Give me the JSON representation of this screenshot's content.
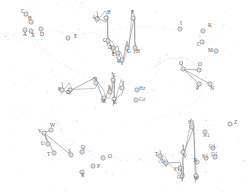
{
  "figure": {
    "type": "scatter-trajectory-diagram",
    "width": 248,
    "height": 192,
    "background_color": "#fefefe",
    "marker_color": "#6b6b70",
    "line_color": "#7a7a80",
    "dot_color": "#b9b9be",
    "label_color": "#58585c"
  },
  "chart_data": {
    "type": "scatter",
    "title": "",
    "subtitle": "",
    "xlabel": "",
    "ylabel": "",
    "grid": false,
    "legend": null,
    "axes_visible": false,
    "xlim": [
      0,
      248
    ],
    "ylim": [
      0,
      192
    ],
    "clusters": [
      {
        "name": "cluster-top-left",
        "labels": [
          "C",
          "B",
          "A",
          "X",
          "D",
          "E"
        ],
        "points": [
          {
            "label": "C",
            "x": 26,
            "y": 14,
            "lx": 21,
            "ly": 12
          },
          {
            "label": "B",
            "x": 31,
            "y": 22,
            "lx": 28,
            "ly": 19
          },
          {
            "label": "A",
            "x": 25,
            "y": 30,
            "lx": 23,
            "ly": 35
          },
          {
            "label": "X",
            "x": 31,
            "y": 31,
            "lx": 31,
            "ly": 36
          },
          {
            "label": "D",
            "x": 41,
            "y": 29,
            "lx": 40,
            "ly": 35
          },
          {
            "label": "E",
            "x": 68,
            "y": 38,
            "lx": 74,
            "ly": 37
          }
        ]
      },
      {
        "name": "cluster-top-center",
        "labels": [
          "A+",
          "B",
          "F",
          "C",
          "D",
          "E",
          "G",
          "H",
          "R"
        ],
        "points": [
          {
            "label": "A+",
            "x": 97,
            "y": 19,
            "lx": 92,
            "ly": 18
          },
          {
            "label": "B",
            "x": 106,
            "y": 18,
            "lx": 107,
            "ly": 13
          },
          {
            "label": "F",
            "x": 133,
            "y": 18,
            "lx": 131,
            "ly": 13
          },
          {
            "label": "C",
            "x": 108,
            "y": 41,
            "lx": 103,
            "ly": 41
          },
          {
            "label": "D",
            "x": 113,
            "y": 48,
            "lx": 108,
            "ly": 48
          },
          {
            "label": "E",
            "x": 118,
            "y": 53,
            "lx": 112,
            "ly": 55
          },
          {
            "label": "G",
            "x": 127,
            "y": 48,
            "lx": 127,
            "ly": 52
          },
          {
            "label": "H",
            "x": 135,
            "y": 48,
            "lx": 136,
            "ly": 52
          },
          {
            "label": "R",
            "x": 122,
            "y": 60,
            "lx": 117,
            "ly": 62
          }
        ]
      },
      {
        "name": "cluster-top-right",
        "labels": [
          "I",
          "K",
          "L",
          "M"
        ],
        "points": [
          {
            "label": "I",
            "x": 180,
            "y": 29,
            "lx": 180,
            "ly": 24
          },
          {
            "label": "K",
            "x": 203,
            "y": 31,
            "lx": 208,
            "ly": 26
          },
          {
            "label": "L",
            "x": 202,
            "y": 42,
            "lx": 197,
            "ly": 45
          },
          {
            "label": "M",
            "x": 216,
            "y": 51,
            "lx": 208,
            "ly": 51
          }
        ]
      },
      {
        "name": "cluster-right",
        "labels": [
          "Q",
          "O",
          "P",
          "N"
        ],
        "points": [
          {
            "label": "Q",
            "x": 183,
            "y": 69,
            "lx": 179,
            "ly": 64
          },
          {
            "label": "O",
            "x": 199,
            "y": 70,
            "lx": 198,
            "ly": 65
          },
          {
            "label": "P",
            "x": 199,
            "y": 84,
            "lx": 196,
            "ly": 89
          },
          {
            "label": "N",
            "x": 210,
            "y": 84,
            "lx": 210,
            "ly": 89
          }
        ]
      },
      {
        "name": "cluster-center",
        "labels": [
          "F",
          "D",
          "N",
          "L",
          "I",
          "J",
          "M",
          "K",
          "Hz",
          "Gz"
        ],
        "points": [
          {
            "label": "F",
            "x": 62,
            "y": 90,
            "lx": 58,
            "ly": 90
          },
          {
            "label": "D",
            "x": 70,
            "y": 90,
            "lx": 66,
            "ly": 93
          },
          {
            "label": "N",
            "x": 96,
            "y": 83,
            "lx": 93,
            "ly": 80
          },
          {
            "label": "L",
            "x": 113,
            "y": 80,
            "lx": 113,
            "ly": 76
          },
          {
            "label": "I",
            "x": 110,
            "y": 92,
            "lx": 108,
            "ly": 88
          },
          {
            "label": "J",
            "x": 122,
            "y": 88,
            "lx": 122,
            "ly": 84
          },
          {
            "label": "M",
            "x": 104,
            "y": 98,
            "lx": 101,
            "ly": 102
          },
          {
            "label": "K",
            "x": 114,
            "y": 99,
            "lx": 113,
            "ly": 103
          },
          {
            "label": "Hz",
            "x": 137,
            "y": 90,
            "lx": 139,
            "ly": 89
          },
          {
            "label": "Gz",
            "x": 136,
            "y": 100,
            "lx": 139,
            "ly": 100
          }
        ]
      },
      {
        "name": "cluster-bottom-left",
        "labels": [
          "V",
          "W",
          "U",
          "T",
          "S",
          "Q",
          "O",
          "P",
          "R"
        ],
        "points": [
          {
            "label": "V",
            "x": 44,
            "y": 133,
            "lx": 38,
            "ly": 132
          },
          {
            "label": "W",
            "x": 51,
            "y": 130,
            "lx": 50,
            "ly": 126
          },
          {
            "label": "U",
            "x": 48,
            "y": 144,
            "lx": 41,
            "ly": 144
          },
          {
            "label": "T",
            "x": 54,
            "y": 153,
            "lx": 47,
            "ly": 155
          },
          {
            "label": "S",
            "x": 71,
            "y": 155,
            "lx": 68,
            "ly": 152
          },
          {
            "label": "Q",
            "x": 82,
            "y": 152,
            "lx": 81,
            "ly": 148
          },
          {
            "label": "O",
            "x": 103,
            "y": 158,
            "lx": 108,
            "ly": 157
          },
          {
            "label": "P",
            "x": 93,
            "y": 166,
            "lx": 97,
            "ly": 167
          },
          {
            "label": "R",
            "x": 82,
            "y": 172,
            "lx": 81,
            "ly": 176
          }
        ]
      },
      {
        "name": "cluster-bottom-right",
        "labels": [
          "B1",
          "Z",
          "A1",
          "C1",
          "T",
          "V",
          "U",
          "X",
          "E1",
          "D1",
          "F1",
          "G1",
          "W"
        ],
        "points": [
          {
            "label": "B1",
            "x": 192,
            "y": 127,
            "lx": 188,
            "ly": 123
          },
          {
            "label": "Z",
            "x": 230,
            "y": 124,
            "lx": 234,
            "ly": 123
          },
          {
            "label": "A1",
            "x": 205,
            "y": 132,
            "lx": 203,
            "ly": 136
          },
          {
            "label": "C1",
            "x": 213,
            "y": 148,
            "lx": 209,
            "ly": 147
          },
          {
            "label": "T",
            "x": 160,
            "y": 156,
            "lx": 155,
            "ly": 155
          },
          {
            "label": "V",
            "x": 183,
            "y": 152,
            "lx": 183,
            "ly": 157
          },
          {
            "label": "U",
            "x": 166,
            "y": 163,
            "lx": 161,
            "ly": 162
          },
          {
            "label": "X",
            "x": 197,
            "y": 162,
            "lx": 193,
            "ly": 161
          },
          {
            "label": "E1",
            "x": 206,
            "y": 158,
            "lx": 202,
            "ly": 157
          },
          {
            "label": "D1",
            "x": 215,
            "y": 157,
            "lx": 211,
            "ly": 155
          },
          {
            "label": "F1",
            "x": 180,
            "y": 168,
            "lx": 174,
            "ly": 170
          },
          {
            "label": "G1",
            "x": 182,
            "y": 176,
            "lx": 177,
            "ly": 178
          },
          {
            "label": "W",
            "x": 196,
            "y": 176,
            "lx": 194,
            "ly": 179
          }
        ]
      }
    ],
    "links": [
      {
        "from": "cluster-top-center",
        "kind": "zigzag",
        "count": 9
      },
      {
        "from": "cluster-center",
        "kind": "zigzag",
        "count": 8
      },
      {
        "from": "cluster-bottom-right",
        "kind": "zigzag",
        "count": 7
      },
      {
        "from": "cluster-bottom-left",
        "kind": "fan",
        "count": 4
      },
      {
        "from": "cluster-right",
        "kind": "fan",
        "count": 3
      }
    ],
    "marker_count": 58,
    "dotted_field_point_count": 120
  }
}
